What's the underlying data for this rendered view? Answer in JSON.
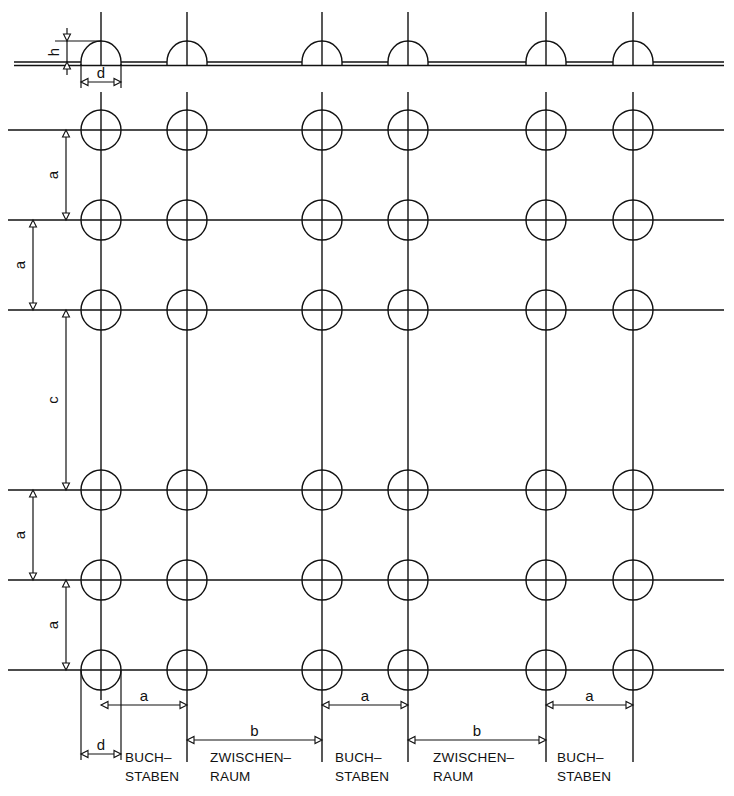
{
  "diagram": {
    "colors": {
      "line": "#111111",
      "background": "#ffffff"
    },
    "columns_x": [
      101,
      187,
      322,
      408,
      546,
      633
    ],
    "rows_y": [
      130,
      220,
      310,
      490,
      580,
      670
    ],
    "dot_radius": 20,
    "profile": {
      "baseline_y": 64,
      "dome_height": 21,
      "line_x_start": 14,
      "line_x_end": 724
    },
    "grid_line_x_start": 8,
    "grid_line_x_end": 724,
    "labels": {
      "h": "h",
      "d": "d",
      "a": "a",
      "b": "b",
      "c": "c"
    },
    "vertical_dimensions": [
      {
        "label": "a",
        "x": 66,
        "y1": 130,
        "y2": 220
      },
      {
        "label": "a",
        "x": 33,
        "y1": 220,
        "y2": 310
      },
      {
        "label": "c",
        "x": 66,
        "y1": 310,
        "y2": 490
      },
      {
        "label": "a",
        "x": 33,
        "y1": 490,
        "y2": 580
      },
      {
        "label": "a",
        "x": 66,
        "y1": 580,
        "y2": 670
      }
    ],
    "horizontal_dimensions": [
      {
        "label": "a",
        "y": 705,
        "x1": 101,
        "x2": 187
      },
      {
        "label": "b",
        "y": 740,
        "x1": 187,
        "x2": 322
      },
      {
        "label": "a",
        "y": 705,
        "x1": 322,
        "x2": 408
      },
      {
        "label": "b",
        "y": 740,
        "x1": 408,
        "x2": 546
      },
      {
        "label": "a",
        "y": 705,
        "x1": 546,
        "x2": 633
      },
      {
        "label": "d",
        "y": 754,
        "x1": 81,
        "x2": 121
      },
      {
        "label": "d",
        "y": 82,
        "x1": 81,
        "x2": 121
      }
    ],
    "captions": [
      {
        "line1": "BUCH–",
        "line2": "STABEN",
        "x": 125
      },
      {
        "line1": "ZWISCHEN–",
        "line2": "RAUM",
        "x": 210
      },
      {
        "line1": "BUCH–",
        "line2": "STABEN",
        "x": 335
      },
      {
        "line1": "ZWISCHEN–",
        "line2": "RAUM",
        "x": 433
      },
      {
        "line1": "BUCH–",
        "line2": "STABEN",
        "x": 557
      }
    ]
  }
}
